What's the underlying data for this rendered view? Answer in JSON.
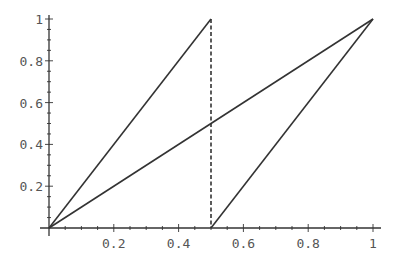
{
  "chart_data": {
    "type": "line",
    "title": "",
    "xlabel": "",
    "ylabel": "",
    "xlim": [
      0,
      1
    ],
    "ylim": [
      0,
      1
    ],
    "grid": false,
    "legend": null,
    "x_ticks": [
      "0.2",
      "0.4",
      "0.6",
      "0.8",
      "1"
    ],
    "y_ticks": [
      "0.2",
      "0.4",
      "0.6",
      "0.8",
      "1"
    ],
    "series": [
      {
        "name": "sawtooth-left",
        "style": "solid",
        "points": [
          [
            0,
            0
          ],
          [
            0.5,
            1
          ]
        ]
      },
      {
        "name": "sawtooth-jump",
        "style": "dashed",
        "points": [
          [
            0.5,
            1
          ],
          [
            0.5,
            0
          ]
        ]
      },
      {
        "name": "sawtooth-right",
        "style": "solid",
        "points": [
          [
            0.5,
            0
          ],
          [
            1,
            1
          ]
        ]
      },
      {
        "name": "identity",
        "style": "solid",
        "points": [
          [
            0,
            0
          ],
          [
            1,
            1
          ]
        ]
      }
    ],
    "colors": {
      "line": "#333333",
      "axis": "#333333",
      "text": "#555555"
    }
  }
}
